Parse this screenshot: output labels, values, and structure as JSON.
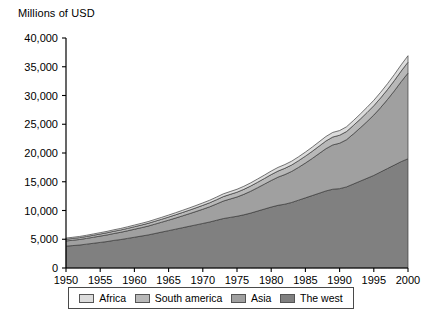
{
  "chart_data": {
    "type": "area",
    "stacked": true,
    "title": "Millions of USD",
    "xlabel": "",
    "ylabel": "Millions of USD",
    "xlim": [
      1950,
      2000
    ],
    "ylim": [
      0,
      40000
    ],
    "grid": false,
    "legend_position": "bottom",
    "x": [
      1950,
      1951,
      1952,
      1953,
      1954,
      1955,
      1956,
      1957,
      1958,
      1959,
      1960,
      1961,
      1962,
      1963,
      1964,
      1965,
      1966,
      1967,
      1968,
      1969,
      1970,
      1971,
      1972,
      1973,
      1974,
      1975,
      1976,
      1977,
      1978,
      1979,
      1980,
      1981,
      1982,
      1983,
      1984,
      1985,
      1986,
      1987,
      1988,
      1989,
      1990,
      1991,
      1992,
      1993,
      1994,
      1995,
      1996,
      1997,
      1998,
      1999,
      2000
    ],
    "x_tick_labels": [
      "1950",
      "1955",
      "1960",
      "1965",
      "1970",
      "1975",
      "1980",
      "1985",
      "1990",
      "1995",
      "2000"
    ],
    "y_tick_labels": [
      "0",
      "5,000",
      "10,000",
      "15,000",
      "20,000",
      "25,000",
      "30,000",
      "35,000",
      "40,000"
    ],
    "y_tick_values": [
      0,
      5000,
      10000,
      15000,
      20000,
      25000,
      30000,
      35000,
      40000
    ],
    "stack_order_bottom_to_top": [
      "The west",
      "Asia",
      "South america",
      "Africa"
    ],
    "series": [
      {
        "name": "The west",
        "color": "#808080",
        "values": [
          3800,
          3900,
          4000,
          4150,
          4300,
          4450,
          4600,
          4800,
          4950,
          5150,
          5350,
          5550,
          5750,
          6000,
          6250,
          6500,
          6750,
          7000,
          7250,
          7500,
          7750,
          8000,
          8300,
          8600,
          8800,
          9000,
          9250,
          9550,
          9900,
          10250,
          10600,
          10900,
          11100,
          11400,
          11800,
          12200,
          12600,
          13000,
          13400,
          13700,
          13800,
          14100,
          14600,
          15100,
          15600,
          16100,
          16700,
          17300,
          17900,
          18500,
          19000
        ]
      },
      {
        "name": "Asia",
        "color": "#a0a0a0",
        "values": [
          900,
          930,
          960,
          1000,
          1050,
          1100,
          1150,
          1200,
          1260,
          1320,
          1390,
          1460,
          1540,
          1630,
          1720,
          1820,
          1930,
          2050,
          2180,
          2320,
          2470,
          2640,
          2830,
          3040,
          3200,
          3350,
          3560,
          3800,
          4060,
          4330,
          4620,
          4900,
          5150,
          5400,
          5700,
          6050,
          6450,
          6900,
          7350,
          7700,
          7900,
          8200,
          8700,
          9250,
          9850,
          10500,
          11200,
          12000,
          12900,
          13900,
          14900
        ]
      },
      {
        "name": "South america",
        "color": "#b8b8b8",
        "values": [
          300,
          310,
          320,
          330,
          345,
          360,
          375,
          390,
          405,
          420,
          440,
          455,
          475,
          495,
          515,
          540,
          565,
          590,
          615,
          645,
          675,
          705,
          740,
          775,
          805,
          835,
          870,
          905,
          945,
          985,
          1025,
          1060,
          1090,
          1120,
          1160,
          1200,
          1245,
          1290,
          1335,
          1375,
          1390,
          1420,
          1470,
          1520,
          1570,
          1620,
          1675,
          1730,
          1790,
          1845,
          1900
        ]
      },
      {
        "name": "Africa",
        "color": "#dcdcdc",
        "values": [
          200,
          205,
          210,
          215,
          225,
          235,
          245,
          255,
          265,
          275,
          285,
          295,
          305,
          320,
          330,
          345,
          360,
          375,
          390,
          405,
          425,
          440,
          460,
          480,
          495,
          510,
          530,
          550,
          570,
          590,
          615,
          635,
          650,
          665,
          685,
          710,
          735,
          760,
          785,
          805,
          815,
          830,
          855,
          885,
          915,
          945,
          980,
          1015,
          1050,
          1090,
          1120
        ]
      }
    ],
    "totals": [
      5200,
      5345,
      5490,
      5695,
      5920,
      6145,
      6370,
      6645,
      6880,
      7165,
      7465,
      7760,
      8070,
      8445,
      8815,
      9205,
      9605,
      10015,
      10435,
      10870,
      11320,
      11785,
      12330,
      12895,
      13300,
      13695,
      14210,
      14805,
      15475,
      16155,
      16860,
      17495,
      17990,
      18585,
      19345,
      20160,
      21030,
      21950,
      22870,
      23580,
      23905,
      24550,
      25625,
      26755,
      27935,
      29165,
      30555,
      32045,
      33640,
      35335,
      36920
    ]
  },
  "legend": {
    "items": [
      {
        "label": "Africa",
        "color": "#dcdcdc"
      },
      {
        "label": "South america",
        "color": "#b8b8b8"
      },
      {
        "label": "Asia",
        "color": "#a0a0a0"
      },
      {
        "label": "The west",
        "color": "#808080"
      }
    ]
  },
  "axes": {
    "y_title": "Millions of USD"
  }
}
